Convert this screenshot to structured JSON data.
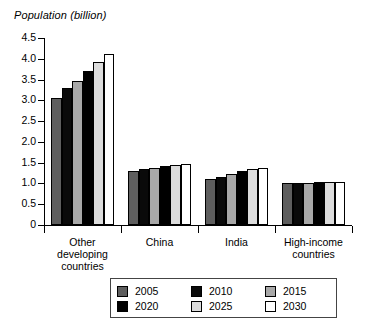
{
  "chart_data": {
    "type": "bar",
    "title": "",
    "ylabel": "Population (billion)",
    "xlabel": "",
    "ylim": [
      0,
      4.5
    ],
    "yticks": [
      "0",
      "0.5",
      "1.0",
      "1.5",
      "2.0",
      "2.5",
      "3.0",
      "3.5",
      "4.0",
      "4.5"
    ],
    "ytick_values": [
      0,
      0.5,
      1.0,
      1.5,
      2.0,
      2.5,
      3.0,
      3.5,
      4.0,
      4.5
    ],
    "grid": false,
    "legend_position": "bottom",
    "categories": [
      "Other developing countries",
      "China",
      "India",
      "High-income countries"
    ],
    "category_lines": [
      [
        "Other",
        "developing",
        "countries"
      ],
      [
        "China"
      ],
      [
        "India"
      ],
      [
        "High-income",
        "countries"
      ]
    ],
    "series": [
      {
        "name": "2005",
        "color": "#5e5e5e",
        "values": [
          3.05,
          1.3,
          1.1,
          1.0
        ]
      },
      {
        "name": "2010",
        "color": "#0a0a0a",
        "values": [
          3.3,
          1.34,
          1.16,
          1.01
        ]
      },
      {
        "name": "2015",
        "color": "#a8a8a8",
        "values": [
          3.46,
          1.37,
          1.23,
          1.02
        ]
      },
      {
        "name": "2020",
        "color": "#000000",
        "values": [
          3.7,
          1.41,
          1.29,
          1.03
        ]
      },
      {
        "name": "2025",
        "color": "#dcdcdc",
        "values": [
          3.92,
          1.45,
          1.34,
          1.04
        ]
      },
      {
        "name": "2030",
        "color": "#ffffff",
        "values": [
          4.12,
          1.48,
          1.38,
          1.04
        ]
      }
    ]
  },
  "legend": {
    "entries": [
      {
        "label": "2005",
        "color": "#5e5e5e"
      },
      {
        "label": "2010",
        "color": "#0a0a0a"
      },
      {
        "label": "2015",
        "color": "#a8a8a8"
      },
      {
        "label": "2020",
        "color": "#000000"
      },
      {
        "label": "2025",
        "color": "#dcdcdc"
      },
      {
        "label": "2030",
        "color": "#ffffff"
      }
    ]
  }
}
